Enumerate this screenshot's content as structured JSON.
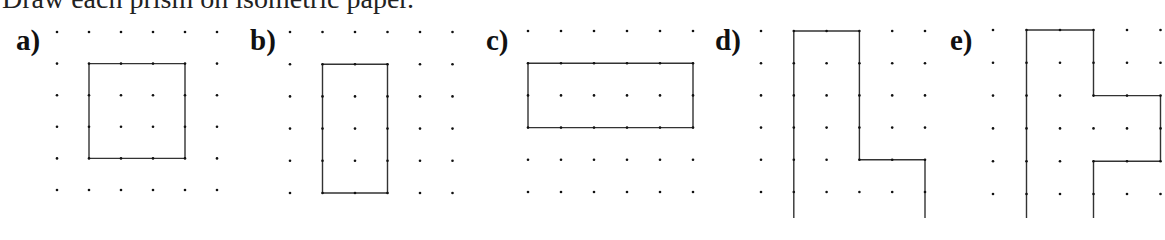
{
  "instruction": "Draw each prism on isometric paper.",
  "figures": [
    {
      "label": "a)",
      "label_pos": [
        16,
        29
      ],
      "grid": {
        "x0": 57,
        "y0": 32,
        "dx": 32,
        "dy": 31.6,
        "cols": 6,
        "rows": 7
      },
      "shape": [
        [
          1,
          1
        ],
        [
          4,
          1
        ],
        [
          4,
          4
        ],
        [
          1,
          4
        ]
      ],
      "closed": true
    },
    {
      "label": "b)",
      "label_pos": [
        250,
        29
      ],
      "grid": {
        "x0": 290,
        "y0": 32,
        "dx": 32.5,
        "dy": 32.2,
        "cols": 6,
        "rows": 6
      },
      "shape": [
        [
          1,
          1
        ],
        [
          3,
          1
        ],
        [
          3,
          5
        ],
        [
          1,
          5
        ]
      ],
      "closed": true
    },
    {
      "label": "c)",
      "label_pos": [
        486,
        29
      ],
      "grid": {
        "x0": 528,
        "y0": 31,
        "dx": 33,
        "dy": 32.2,
        "cols": 6,
        "rows": 6
      },
      "shape": [
        [
          0,
          1
        ],
        [
          5,
          1
        ],
        [
          5,
          3
        ],
        [
          0,
          3
        ]
      ],
      "closed": true
    },
    {
      "label": "d)",
      "label_pos": [
        715,
        29
      ],
      "grid": {
        "x0": 761,
        "y0": 31,
        "dx": 32.8,
        "dy": 32.2,
        "cols": 6,
        "rows": 7
      },
      "shape": [
        [
          1,
          7.5
        ],
        [
          1,
          0
        ],
        [
          3,
          0
        ],
        [
          3,
          4
        ],
        [
          5,
          4
        ],
        [
          5,
          7.5
        ]
      ],
      "closed": false
    },
    {
      "label": "e)",
      "label_pos": [
        950,
        29
      ],
      "grid": {
        "x0": 993,
        "y0": 30,
        "dx": 33.5,
        "dy": 32.8,
        "cols": 6,
        "rows": 7
      },
      "shape": [
        [
          1,
          7.5
        ],
        [
          1,
          0
        ],
        [
          3,
          0
        ],
        [
          3,
          2
        ],
        [
          5,
          2
        ],
        [
          5,
          4
        ],
        [
          3,
          4
        ],
        [
          3,
          7.5
        ]
      ],
      "closed": false
    }
  ],
  "colors": {
    "dot": "#111111",
    "line": "#333333"
  }
}
